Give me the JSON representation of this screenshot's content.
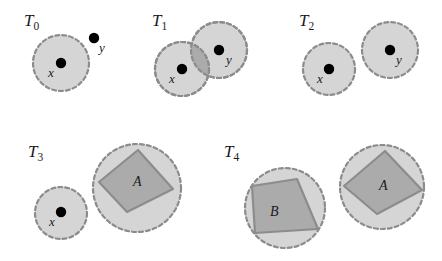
{
  "figure": {
    "width": 442,
    "height": 261,
    "background": "#ffffff",
    "style": {
      "region_fill": "#d5d5d5",
      "region_stroke": "#8c8c8c",
      "overlap_fill": "#ababab",
      "polygon_fill": "#ababab",
      "polygon_stroke": "#8c8c8c",
      "point_fill": "#000000",
      "text_color": "#1a1a1a",
      "dash_pattern": "4 3",
      "stroke_width": 2.2
    }
  },
  "panels": [
    {
      "id": "T0",
      "label": "T",
      "subscript": "0",
      "label_pos": {
        "x": 24,
        "y": 26
      },
      "regions": [
        {
          "name": "region-x",
          "cx": 61,
          "cy": 63,
          "r": 28
        }
      ],
      "points": [
        {
          "name": "point-x",
          "cx": 61,
          "cy": 63,
          "r": 5.2,
          "label": "x",
          "lx": 48,
          "ly": 77
        },
        {
          "name": "point-y",
          "cx": 94,
          "cy": 38,
          "r": 5.2,
          "label": "y",
          "lx": 99,
          "ly": 52
        }
      ],
      "polygons": []
    },
    {
      "id": "T1",
      "label": "T",
      "subscript": "1",
      "label_pos": {
        "x": 152,
        "y": 26
      },
      "regions": [
        {
          "name": "region-y",
          "cx": 219,
          "cy": 50,
          "r": 28
        },
        {
          "name": "region-x",
          "cx": 182,
          "cy": 69,
          "r": 27
        }
      ],
      "points": [
        {
          "name": "point-x",
          "cx": 182,
          "cy": 69,
          "r": 5.2,
          "label": "x",
          "lx": 169,
          "ly": 83
        },
        {
          "name": "point-y",
          "cx": 219,
          "cy": 50,
          "r": 5.2,
          "label": "y",
          "lx": 226,
          "ly": 64
        }
      ],
      "polygons": []
    },
    {
      "id": "T2",
      "label": "T",
      "subscript": "2",
      "label_pos": {
        "x": 299,
        "y": 26
      },
      "regions": [
        {
          "name": "region-x",
          "cx": 329,
          "cy": 69,
          "r": 26
        },
        {
          "name": "region-y",
          "cx": 390,
          "cy": 50,
          "r": 28
        }
      ],
      "points": [
        {
          "name": "point-x",
          "cx": 329,
          "cy": 69,
          "r": 5.2,
          "label": "x",
          "lx": 317,
          "ly": 83
        },
        {
          "name": "point-y",
          "cx": 390,
          "cy": 50,
          "r": 5.2,
          "label": "y",
          "lx": 396,
          "ly": 64
        }
      ],
      "polygons": []
    },
    {
      "id": "T3",
      "label": "T",
      "subscript": "3",
      "label_pos": {
        "x": 28,
        "y": 157
      },
      "regions": [
        {
          "name": "region-x",
          "cx": 61,
          "cy": 213,
          "r": 26
        },
        {
          "name": "region-a",
          "cx": 137,
          "cy": 188,
          "r": 44
        }
      ],
      "points": [
        {
          "name": "point-x",
          "cx": 61,
          "cy": 212,
          "r": 5.2,
          "label": "x",
          "lx": 49,
          "ly": 226
        }
      ],
      "polygons": [
        {
          "name": "polygon-a",
          "label": "A",
          "lx": 133,
          "ly": 186,
          "vertices": "99,182 138,150 173,189 127,212"
        }
      ]
    },
    {
      "id": "T4",
      "label": "T",
      "subscript": "4",
      "label_pos": {
        "x": 224,
        "y": 157
      },
      "regions": [
        {
          "name": "region-b",
          "cx": 285,
          "cy": 208,
          "r": 40
        },
        {
          "name": "region-a",
          "cx": 382,
          "cy": 187,
          "r": 42
        }
      ],
      "points": [],
      "polygons": [
        {
          "name": "polygon-b",
          "label": "B",
          "lx": 270,
          "ly": 216,
          "vertices": "252,186 297,179 318,229 255,233"
        },
        {
          "name": "polygon-a",
          "label": "A",
          "lx": 379,
          "ly": 190,
          "vertices": "344,186 385,151 422,190 377,214"
        }
      ]
    }
  ]
}
